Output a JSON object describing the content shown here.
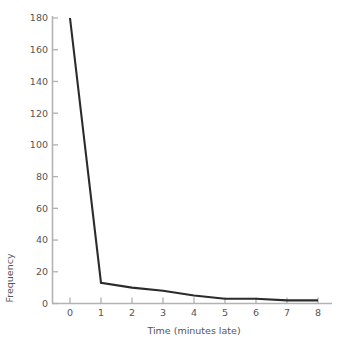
{
  "chart_data": {
    "type": "line",
    "title": "",
    "subtitle": "",
    "xlabel": "Time (minutes late)",
    "ylabel": "Frequency",
    "x": [
      0,
      1,
      2,
      3,
      4,
      5,
      6,
      7,
      8
    ],
    "values": [
      180,
      13,
      10,
      8,
      5,
      3,
      3,
      2,
      2
    ],
    "series": [
      {
        "name": "Frequency",
        "values": [
          180,
          13,
          10,
          8,
          5,
          3,
          3,
          2,
          2
        ]
      }
    ],
    "xlim": [
      0,
      8
    ],
    "ylim": [
      0,
      180
    ],
    "x_ticks": [
      0,
      1,
      2,
      3,
      4,
      5,
      6,
      7,
      8
    ],
    "x_tick_labels": [
      "0",
      "1",
      "2",
      "3",
      "4",
      "5",
      "6",
      "7",
      "8"
    ],
    "y_ticks": [
      0,
      20,
      40,
      60,
      80,
      100,
      120,
      140,
      160,
      180
    ],
    "y_tick_labels": [
      "0",
      "20",
      "40",
      "60",
      "80",
      "100",
      "120",
      "140",
      "160",
      "180"
    ],
    "grid": false,
    "legend": false,
    "legend_position": "none",
    "annotations": [],
    "colors": {
      "line": "#2b2b2b",
      "axis": "#b3b3b3",
      "text": "#555555",
      "background": "#ffffff"
    }
  },
  "axis_titles": {
    "x": "Time (minutes late)",
    "y": "Frequency"
  }
}
